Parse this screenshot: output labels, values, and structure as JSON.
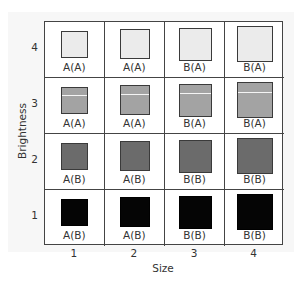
{
  "chart_data": {
    "type": "table",
    "title": "",
    "xlabel": "Size",
    "ylabel": "Brightness",
    "x_ticks": [
      "1",
      "2",
      "3",
      "4"
    ],
    "y_ticks": [
      "4",
      "3",
      "2",
      "1"
    ],
    "rows": [
      {
        "brightness": "4",
        "color": "#ebebeb",
        "stripe": false,
        "labels": [
          "A(A)",
          "A(A)",
          "B(A)",
          "B(A)"
        ]
      },
      {
        "brightness": "3",
        "color": "#a3a3a3",
        "stripe": true,
        "labels": [
          "A(A)",
          "A(A)",
          "B(A)",
          "B(A)"
        ]
      },
      {
        "brightness": "2",
        "color": "#6b6b6b",
        "stripe": false,
        "labels": [
          "A(B)",
          "A(B)",
          "B(B)",
          "B(B)"
        ]
      },
      {
        "brightness": "1",
        "color": "#050505",
        "stripe": false,
        "labels": [
          "A(B)",
          "A(B)",
          "B(B)",
          "B(B)"
        ]
      }
    ],
    "square_sizes_px": [
      27,
      30,
      33,
      36
    ]
  },
  "axes": {
    "xlabel": "Size",
    "ylabel": "Brightness",
    "x_ticks": [
      "1",
      "2",
      "3",
      "4"
    ],
    "y_ticks": [
      "4",
      "3",
      "2",
      "1"
    ]
  }
}
